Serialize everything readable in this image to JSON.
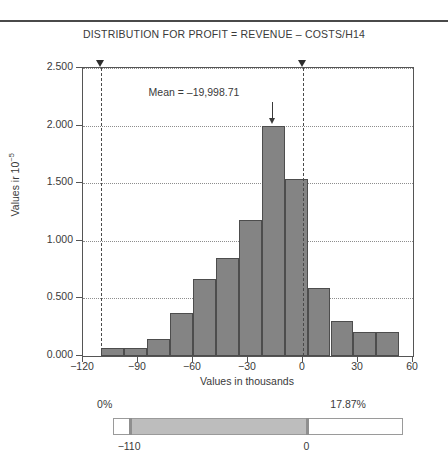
{
  "header": {
    "title": "DISTRIBUTION FOR PROFIT = REVENUE – COSTS/H14"
  },
  "annotation": {
    "mean_label": "Mean = –19,998.71"
  },
  "axes": {
    "xlabel": "Values in thousands",
    "ylabel_prefix": "Values ir 10",
    "ylabel_exponent": "−5",
    "yticks": [
      "0.000",
      "0.500",
      "1.000",
      "1.500",
      "2.000",
      "2.500"
    ],
    "xticks": [
      "−120",
      "−90",
      "−60",
      "−30",
      "0",
      "30",
      "60"
    ]
  },
  "slider": {
    "left_percent": "0%",
    "right_percent": "17.87%",
    "left_bound": "−110",
    "right_bound": "0"
  },
  "colors": {
    "bar_fill": "#848484",
    "bar_stroke": "#4d4d4d",
    "axis": "#555555",
    "grid": "#8d8d8d",
    "slider_fill": "#bdbdbd",
    "text": "#3a3a3a"
  },
  "chart_data": {
    "type": "bar",
    "title": "DISTRIBUTION FOR PROFIT = REVENUE – COSTS/H14",
    "xlabel": "Values in thousands",
    "ylabel": "Values in 10−5",
    "xlim": [
      -120,
      60
    ],
    "ylim": [
      0.0,
      2.5
    ],
    "grid": true,
    "legend": null,
    "bin_width": 12.5,
    "bin_left_edges": [
      -110,
      -97.5,
      -85,
      -72.5,
      -60,
      -47.5,
      -35,
      -22.5,
      -10,
      2.5,
      15,
      27.5,
      40
    ],
    "bin_centers": [
      -103.75,
      -91.25,
      -78.75,
      -66.25,
      -53.75,
      -41.25,
      -28.75,
      -16.25,
      -3.75,
      8.75,
      21.25,
      33.75,
      46.25
    ],
    "values": [
      0.07,
      0.07,
      0.15,
      0.37,
      0.67,
      0.85,
      1.18,
      2.0,
      1.54,
      0.59,
      0.3,
      0.21,
      0.21
    ],
    "mean": -19998.71,
    "certainty_lower": -110,
    "certainty_upper": 0,
    "certainty_percent": 17.87
  }
}
